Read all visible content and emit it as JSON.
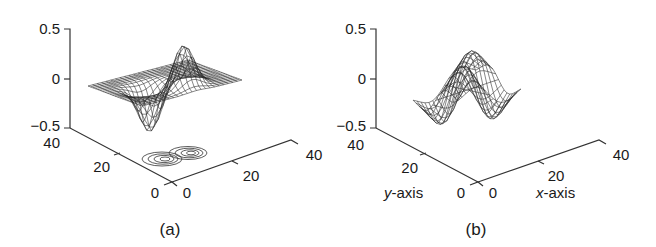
{
  "figure": {
    "panels": [
      {
        "id": "a",
        "caption": "(a)",
        "z_ticks": [
          "0.5",
          "0",
          "−0.5"
        ],
        "y_ticks": [
          "40",
          "20",
          "0"
        ],
        "x_ticks": [
          "0",
          "20",
          "40"
        ],
        "y_axis_label": "",
        "x_axis_label": "",
        "description": "3D mesh surface with a positive peak and negative trough, with contour lines projected on the base plane"
      },
      {
        "id": "b",
        "caption": "(b)",
        "z_ticks": [
          "0.5",
          "0",
          "−0.5"
        ],
        "y_ticks": [
          "40",
          "20",
          "0"
        ],
        "x_ticks": [
          "0",
          "20",
          "40"
        ],
        "y_axis_label_var": "y",
        "y_axis_label_rest": "-axis",
        "x_axis_label_var": "x",
        "x_axis_label_rest": "-axis",
        "description": "3D mesh surface (saddle / derivative-of-Gaussian shape) with positive and negative lobes"
      }
    ]
  },
  "chart_data": [
    {
      "type": "surface3d",
      "title": "(a)",
      "xlabel": "",
      "ylabel": "",
      "zlabel": "",
      "xlim": [
        0,
        40
      ],
      "ylim": [
        0,
        40
      ],
      "zlim": [
        -0.5,
        0.5
      ],
      "x_ticks": [
        0,
        20,
        40
      ],
      "y_ticks": [
        0,
        20,
        40
      ],
      "z_ticks": [
        -0.5,
        0,
        0.5
      ],
      "features": {
        "peak": {
          "approx_z": 0.4
        },
        "trough": {
          "approx_z": -0.45
        },
        "contours_on_base": true
      }
    },
    {
      "type": "surface3d",
      "title": "(b)",
      "xlabel": "x-axis",
      "ylabel": "y-axis",
      "zlabel": "",
      "xlim": [
        0,
        40
      ],
      "ylim": [
        0,
        40
      ],
      "zlim": [
        -0.5,
        0.5
      ],
      "x_ticks": [
        0,
        20,
        40
      ],
      "y_ticks": [
        0,
        20,
        40
      ],
      "z_ticks": [
        -0.5,
        0,
        0.5
      ],
      "features": {
        "peak": {
          "approx_z": 0.3
        },
        "trough": {
          "approx_z": -0.42
        },
        "contours_on_base": false
      }
    }
  ]
}
